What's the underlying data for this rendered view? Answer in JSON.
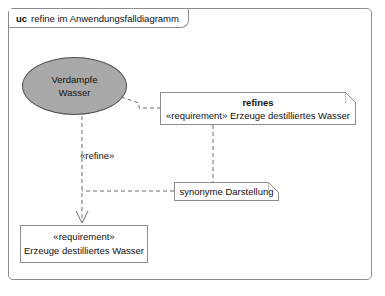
{
  "diagram": {
    "frame": {
      "kind": "uc",
      "title": "refine im Anwendungsfalldiagramm"
    },
    "usecase": {
      "name_line1": "Verdampfe",
      "name_line2": "Wasser",
      "fill_color": "#a9a9a9",
      "border_color": "#4e4e4e"
    },
    "note_refines": {
      "title": "refines",
      "body": "«requirement» Erzeuge destilliertes Wasser"
    },
    "note_synonym": {
      "text": "synonyme Darstellung"
    },
    "requirement_box": {
      "stereotype": "«requirement»",
      "name": "Erzeuge destilliertes Wasser"
    },
    "refine_edge": {
      "label": "«refine»"
    },
    "colors": {
      "frame_border": "#8c8c8c",
      "line": "#6e6e6e",
      "text": "#111111",
      "background": "#ffffff"
    }
  }
}
